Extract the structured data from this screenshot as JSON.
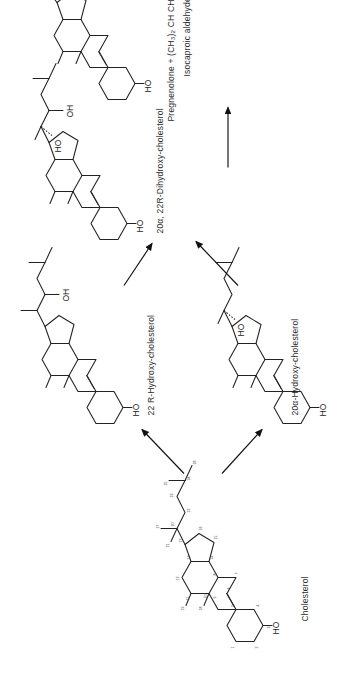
{
  "diagram": {
    "orientation": "rotated-90-ccw",
    "background_color": "#ffffff",
    "line_color": "#222222",
    "text_color": "#2b2b2b"
  },
  "nodes": [
    {
      "id": "cholesterol",
      "label": "Cholesterol",
      "numbered": true,
      "carbon_numbers": [
        "1",
        "2",
        "3",
        "4",
        "5",
        "6",
        "7",
        "8",
        "9",
        "10",
        "11",
        "12",
        "13",
        "14",
        "15",
        "16",
        "17",
        "18",
        "19",
        "20",
        "21",
        "22",
        "23",
        "24",
        "25",
        "26",
        "27"
      ],
      "hydroxyls": [
        "HO"
      ]
    },
    {
      "id": "22r-hydroxy-cholesterol",
      "label": "22 R-Hydroxy-cholesterol",
      "numbered": false,
      "hydroxyls": [
        "OH",
        "HO"
      ]
    },
    {
      "id": "20a-hydroxy-cholesterol",
      "label": "20α-Hydroxy-cholesterol",
      "numbered": false,
      "hydroxyls": [
        "HO",
        "HO"
      ]
    },
    {
      "id": "20a-22r-dihydroxy-cholesterol",
      "label": "20α, 22R-Dihydroxy-cholesterol",
      "numbered": false,
      "hydroxyls": [
        "OH",
        "HO",
        "HO"
      ]
    },
    {
      "id": "pregnenolone",
      "label_line1": "Pregnenolone + (CH3)2 CH CH2 CH2 CHO",
      "label_line1_html": "Pregnenolone + (CH<sub>3</sub>)<sub>2</sub> CH CH<sub>2</sub> CH<sub>2</sub> CHO",
      "label_line2": "Isocaproic aldehyde",
      "numbered": false,
      "hydroxyls": [
        "HO"
      ],
      "carbonyl": "O"
    }
  ],
  "arrows": [
    {
      "id": "arrow-cholesterol-to-22r",
      "from": "cholesterol",
      "to": "22r-hydroxy-cholesterol",
      "style": "solid"
    },
    {
      "id": "arrow-cholesterol-to-20a",
      "from": "cholesterol",
      "to": "20a-hydroxy-cholesterol",
      "style": "solid"
    },
    {
      "id": "arrow-22r-to-dihydroxy",
      "from": "22r-hydroxy-cholesterol",
      "to": "20a-22r-dihydroxy-cholesterol",
      "style": "solid"
    },
    {
      "id": "arrow-20a-to-dihydroxy",
      "from": "20a-hydroxy-cholesterol",
      "to": "20a-22r-dihydroxy-cholesterol",
      "style": "solid"
    },
    {
      "id": "arrow-dihydroxy-to-pregnenolone",
      "from": "20a-22r-dihydroxy-cholesterol",
      "to": "pregnenolone",
      "style": "solid"
    }
  ],
  "atom_labels": {
    "oh": "OH",
    "ho": "HO",
    "o": "O"
  }
}
